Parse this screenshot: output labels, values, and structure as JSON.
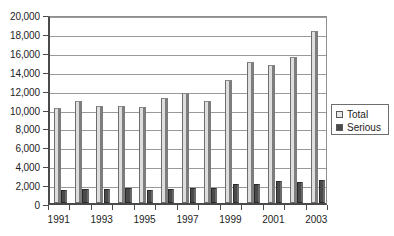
{
  "chart_data": {
    "type": "bar",
    "title": "",
    "subtitle": "",
    "xlabel": "",
    "ylabel": "",
    "ylim": [
      0,
      20000
    ],
    "ytick_values": [
      0,
      2000,
      4000,
      6000,
      8000,
      10000,
      12000,
      14000,
      16000,
      18000,
      20000
    ],
    "ytick_labels": [
      "0",
      "2,000",
      "4,000",
      "6,000",
      "8,000",
      "10,000",
      "12,000",
      "14,000",
      "16,000",
      "18,000",
      "20,000"
    ],
    "grid": true,
    "grid_axis": "y",
    "legend_position": "right",
    "categories": [
      "1991",
      "1992",
      "1993",
      "1994",
      "1995",
      "1996",
      "1997",
      "1998",
      "1999",
      "2000",
      "2001",
      "2002",
      "2003"
    ],
    "xtick_labels_shown": [
      "1991",
      "1993",
      "1995",
      "1997",
      "1999",
      "2001",
      "2003"
    ],
    "series": [
      {
        "name": "Total",
        "color": "#dededd",
        "values": [
          10100,
          10800,
          10300,
          10300,
          10200,
          11100,
          11600,
          10800,
          13000,
          14900,
          14600,
          15400,
          18200
        ]
      },
      {
        "name": "Serious",
        "color": "#4a4a4a",
        "values": [
          1350,
          1500,
          1480,
          1560,
          1420,
          1450,
          1600,
          1620,
          2000,
          2020,
          2320,
          2220,
          2400
        ]
      }
    ]
  },
  "legend": {
    "items": [
      {
        "label": "Total",
        "swatch": "legend-swatch-total"
      },
      {
        "label": "Serious",
        "swatch": "legend-swatch-serious"
      }
    ]
  },
  "colors": {
    "total_fill": "#dededd",
    "serious_fill": "#4a4a4a",
    "axis": "#4a4a4a",
    "gridline": "#9a9a9a",
    "text": "#1d1d1d",
    "background": "#ffffff"
  }
}
